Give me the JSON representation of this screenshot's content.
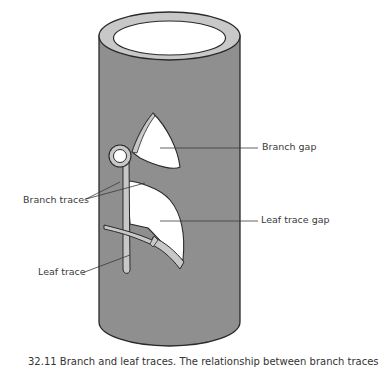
{
  "figure": {
    "colors": {
      "stem_fill": "#8f8f8f",
      "rim_fill": "#c8c8c8",
      "gap_fill": "#ffffff",
      "outline": "#2a2a2a",
      "label_text": "#3a3a3a"
    },
    "labels": {
      "branch_gap": "Branch gap",
      "branch_traces": "Branch traces",
      "leaf_trace_gap": "Leaf trace gap",
      "leaf_trace": "Leaf trace"
    },
    "caption": "32.11  Branch and leaf traces. The relationship between branch traces"
  }
}
